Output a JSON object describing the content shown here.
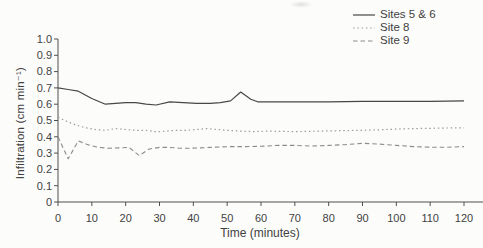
{
  "figure": {
    "background": "#fcfcfb",
    "axis_color": "#4f4f4f",
    "text_color": "#424242"
  },
  "chart_data": {
    "type": "line",
    "title": "",
    "xlabel": "Time (minutes)",
    "ylabel": "Infiltration (cm min⁻¹)",
    "xlim": [
      0,
      120
    ],
    "ylim": [
      0,
      1.0
    ],
    "grid": false,
    "legend_position": "top-right",
    "x_ticks": {
      "values": [
        0,
        10,
        20,
        30,
        40,
        50,
        60,
        70,
        80,
        90,
        100,
        110,
        120
      ],
      "labels": [
        "0",
        "10",
        "20",
        "30",
        "40",
        "50",
        "60",
        "70",
        "80",
        "90",
        "100",
        "110",
        "120"
      ]
    },
    "y_ticks": {
      "values": [
        0,
        0.1,
        0.2,
        0.3,
        0.4,
        0.5,
        0.6,
        0.7,
        0.8,
        0.9,
        1.0
      ],
      "labels": [
        "0",
        "0.1",
        "0.2",
        "0.3",
        "0.4",
        "0.5",
        "0.6",
        "0.7",
        "0.8",
        "0.9",
        "1.0"
      ]
    },
    "series": [
      {
        "id": "sites-5-6",
        "name": "Sites 5 & 6",
        "line_style": "solid",
        "color": "#474747",
        "points": [
          [
            0,
            0.7
          ],
          [
            3,
            0.69
          ],
          [
            6,
            0.68
          ],
          [
            10,
            0.635
          ],
          [
            14,
            0.6
          ],
          [
            17,
            0.605
          ],
          [
            20,
            0.61
          ],
          [
            23,
            0.61
          ],
          [
            26,
            0.6
          ],
          [
            29,
            0.595
          ],
          [
            33,
            0.615
          ],
          [
            37,
            0.61
          ],
          [
            41,
            0.605
          ],
          [
            45,
            0.605
          ],
          [
            48,
            0.61
          ],
          [
            51,
            0.62
          ],
          [
            54,
            0.675
          ],
          [
            57,
            0.63
          ],
          [
            59,
            0.615
          ],
          [
            70,
            0.615
          ],
          [
            80,
            0.615
          ],
          [
            90,
            0.617
          ],
          [
            100,
            0.617
          ],
          [
            110,
            0.618
          ],
          [
            120,
            0.62
          ]
        ]
      },
      {
        "id": "site-8",
        "name": "Site 8",
        "line_style": "dotted",
        "color": "#9c9c9c",
        "points": [
          [
            0,
            0.52
          ],
          [
            2,
            0.5
          ],
          [
            5,
            0.475
          ],
          [
            8,
            0.455
          ],
          [
            11,
            0.445
          ],
          [
            14,
            0.44
          ],
          [
            17,
            0.45
          ],
          [
            20,
            0.445
          ],
          [
            23,
            0.44
          ],
          [
            26,
            0.44
          ],
          [
            29,
            0.43
          ],
          [
            32,
            0.435
          ],
          [
            35,
            0.44
          ],
          [
            38,
            0.44
          ],
          [
            41,
            0.445
          ],
          [
            44,
            0.45
          ],
          [
            47,
            0.445
          ],
          [
            50,
            0.44
          ],
          [
            54,
            0.435
          ],
          [
            58,
            0.432
          ],
          [
            62,
            0.435
          ],
          [
            66,
            0.433
          ],
          [
            70,
            0.432
          ],
          [
            75,
            0.434
          ],
          [
            80,
            0.436
          ],
          [
            85,
            0.438
          ],
          [
            90,
            0.44
          ],
          [
            95,
            0.443
          ],
          [
            100,
            0.447
          ],
          [
            105,
            0.45
          ],
          [
            110,
            0.452
          ],
          [
            115,
            0.454
          ],
          [
            120,
            0.455
          ]
        ]
      },
      {
        "id": "site-9",
        "name": "Site 9",
        "line_style": "dashed",
        "color": "#8b8b8b",
        "points": [
          [
            0,
            0.4
          ],
          [
            3,
            0.265
          ],
          [
            6,
            0.375
          ],
          [
            9,
            0.35
          ],
          [
            12,
            0.335
          ],
          [
            15,
            0.33
          ],
          [
            18,
            0.332
          ],
          [
            21,
            0.335
          ],
          [
            24,
            0.285
          ],
          [
            27,
            0.325
          ],
          [
            30,
            0.335
          ],
          [
            33,
            0.335
          ],
          [
            36,
            0.33
          ],
          [
            39,
            0.33
          ],
          [
            42,
            0.332
          ],
          [
            45,
            0.335
          ],
          [
            48,
            0.338
          ],
          [
            51,
            0.34
          ],
          [
            55,
            0.34
          ],
          [
            60,
            0.342
          ],
          [
            65,
            0.347
          ],
          [
            70,
            0.347
          ],
          [
            75,
            0.343
          ],
          [
            80,
            0.347
          ],
          [
            85,
            0.352
          ],
          [
            90,
            0.36
          ],
          [
            95,
            0.355
          ],
          [
            100,
            0.347
          ],
          [
            105,
            0.34
          ],
          [
            110,
            0.336
          ],
          [
            115,
            0.336
          ],
          [
            120,
            0.34
          ]
        ]
      }
    ]
  }
}
